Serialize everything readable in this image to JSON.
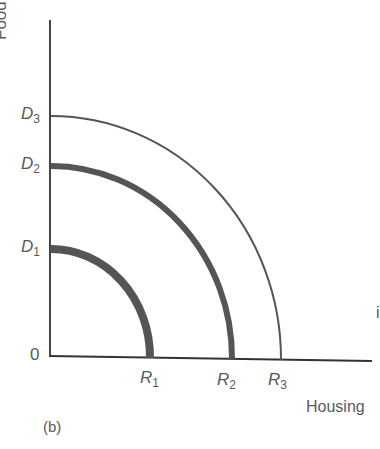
{
  "figure": {
    "panel_label": "(b)",
    "axis_x_label": "Housing",
    "axis_y_label": "Food",
    "origin_label": "0",
    "stray_char": "i",
    "curves": [
      {
        "id": "D1R1",
        "y_label": "D",
        "y_sub": "1",
        "x_label": "R",
        "x_sub": "1",
        "weight": "thick"
      },
      {
        "id": "D2R2",
        "y_label": "D",
        "y_sub": "2",
        "x_label": "R",
        "x_sub": "2",
        "weight": "thick"
      },
      {
        "id": "D3R3",
        "y_label": "D",
        "y_sub": "3",
        "x_label": "R",
        "x_sub": "3",
        "weight": "thin"
      }
    ]
  }
}
